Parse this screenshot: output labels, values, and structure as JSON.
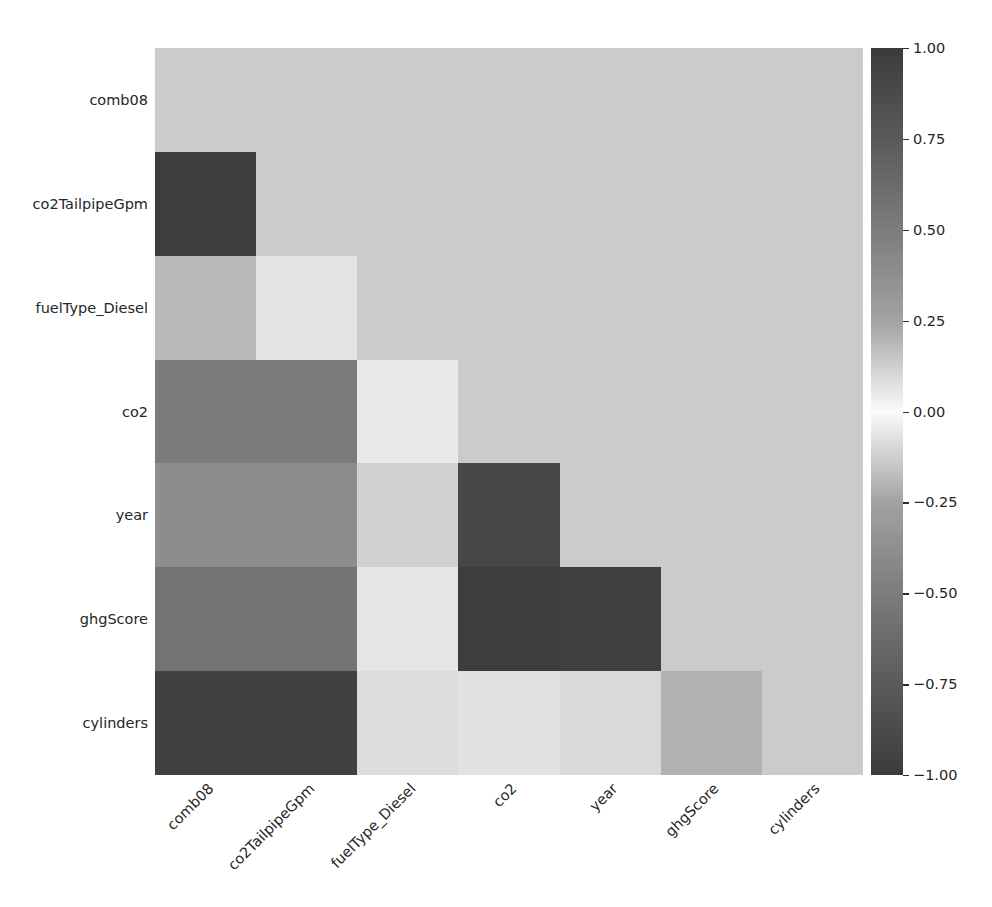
{
  "chart_data": {
    "type": "heatmap",
    "title": "",
    "xlabel": "",
    "ylabel": "",
    "grid": false,
    "mask": "upper-triangle-including-diagonal",
    "mask_color": "#cbcbcb",
    "colormap": "gray-diverging",
    "vmin": -1.0,
    "vmax": 1.0,
    "x_categories": [
      "comb08",
      "co2TailpipeGpm",
      "fuelType_Diesel",
      "co2",
      "year",
      "ghgScore",
      "cylinders"
    ],
    "y_categories": [
      "comb08",
      "co2TailpipeGpm",
      "fuelType_Diesel",
      "co2",
      "year",
      "ghgScore",
      "cylinders"
    ],
    "xtick_rotation": -45,
    "values": [
      [
        null,
        null,
        null,
        null,
        null,
        null,
        null
      ],
      [
        -0.97,
        null,
        null,
        null,
        null,
        null,
        null
      ],
      [
        0.18,
        -0.07,
        null,
        null,
        null,
        null,
        null
      ],
      [
        -0.55,
        -0.55,
        -0.03,
        null,
        null,
        null,
        null
      ],
      [
        -0.44,
        -0.44,
        0.09,
        -0.9,
        null,
        null,
        null
      ],
      [
        -0.6,
        -0.6,
        -0.01,
        -0.94,
        -0.93,
        null,
        null
      ],
      [
        -0.87,
        -0.87,
        0.05,
        0.03,
        0.07,
        0.26,
        null
      ]
    ],
    "cell_colors": [
      [
        "#cbcbcb",
        "#cbcbcb",
        "#cbcbcb",
        "#cbcbcb",
        "#cbcbcb",
        "#cbcbcb",
        "#cbcbcb"
      ],
      [
        "#3d3d3d",
        "#cbcbcb",
        "#cbcbcb",
        "#cbcbcb",
        "#cbcbcb",
        "#cbcbcb",
        "#cbcbcb"
      ],
      [
        "#b9b9b9",
        "#e3e3e3",
        "#cbcbcb",
        "#cbcbcb",
        "#cbcbcb",
        "#cbcbcb",
        "#cbcbcb"
      ],
      [
        "#7b7b7b",
        "#7b7b7b",
        "#e9e9e9",
        "#cbcbcb",
        "#cbcbcb",
        "#cbcbcb",
        "#cbcbcb"
      ],
      [
        "#8d8d8d",
        "#8d8d8d",
        "#d1d1d1",
        "#474747",
        "#cbcbcb",
        "#cbcbcb",
        "#cbcbcb"
      ],
      [
        "#737373",
        "#737373",
        "#e5e5e5",
        "#3d3d3d",
        "#3f3f3f",
        "#cbcbcb",
        "#cbcbcb"
      ],
      [
        "#414141",
        "#414141",
        "#dddddd",
        "#e1e1e1",
        "#d9d9d9",
        "#b1b1b1",
        "#cbcbcb"
      ]
    ],
    "colorbar": {
      "orientation": "vertical",
      "position": "right",
      "ticks": [
        {
          "value": 1.0,
          "label": "1.00"
        },
        {
          "value": 0.75,
          "label": "0.75"
        },
        {
          "value": 0.5,
          "label": "0.50"
        },
        {
          "value": 0.25,
          "label": "0.25"
        },
        {
          "value": 0.0,
          "label": "0.00"
        },
        {
          "value": -0.25,
          "label": "−0.25"
        },
        {
          "value": -0.5,
          "label": "−0.50"
        },
        {
          "value": -0.75,
          "label": "−0.75"
        },
        {
          "value": -1.0,
          "label": "−1.00"
        }
      ]
    }
  }
}
